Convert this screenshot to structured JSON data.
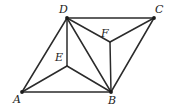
{
  "figure": {
    "canvas": {
      "width": 172,
      "height": 111
    },
    "stroke_color": "#2b2b2b",
    "background_color": "#ffffff",
    "label_color": "#1b1b1b",
    "points": [
      {
        "id": "A",
        "label": "A",
        "x": 22,
        "y": 92,
        "label_x": 13,
        "label_y": 94,
        "marker": true
      },
      {
        "id": "B",
        "label": "B",
        "x": 111,
        "y": 92,
        "label_x": 108,
        "label_y": 95,
        "marker": true
      },
      {
        "id": "C",
        "label": "C",
        "x": 154,
        "y": 18,
        "label_x": 155,
        "label_y": 4,
        "marker": true
      },
      {
        "id": "D",
        "label": "D",
        "x": 67,
        "y": 18,
        "label_x": 59,
        "label_y": 4,
        "marker": true
      },
      {
        "id": "E",
        "label": "E",
        "x": 67,
        "y": 66,
        "label_x": 55,
        "label_y": 52,
        "marker": false
      },
      {
        "id": "F",
        "label": "F",
        "x": 110,
        "y": 42,
        "label_x": 101,
        "label_y": 28,
        "marker": false
      }
    ],
    "edges": [
      {
        "id": "AB",
        "from": "A",
        "to": "B"
      },
      {
        "id": "DC",
        "from": "D",
        "to": "C"
      },
      {
        "id": "AD",
        "from": "A",
        "to": "D"
      },
      {
        "id": "BC",
        "from": "B",
        "to": "C"
      },
      {
        "id": "AE",
        "from": "A",
        "to": "E"
      },
      {
        "id": "DE",
        "from": "D",
        "to": "E"
      },
      {
        "id": "EB",
        "from": "E",
        "to": "B"
      },
      {
        "id": "DB",
        "from": "D",
        "to": "B"
      },
      {
        "id": "DF",
        "from": "D",
        "to": "F"
      },
      {
        "id": "FC",
        "from": "F",
        "to": "C"
      },
      {
        "id": "FB",
        "from": "F",
        "to": "B"
      }
    ]
  }
}
